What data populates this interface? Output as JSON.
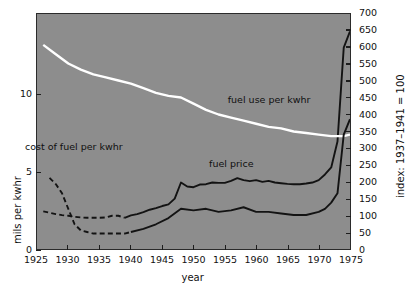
{
  "chart_data": {
    "type": "line",
    "title": "",
    "xlabel": "year",
    "ylabel_left": "mils per kwhr",
    "ylabel_right": "index: 1937–1941 = 100",
    "plot_background": "#8d8d8d",
    "grid": false,
    "legend_position": "inline-annotations",
    "xlim": [
      1925,
      1975
    ],
    "x_ticks": [
      1925,
      1930,
      1935,
      1940,
      1945,
      1950,
      1955,
      1960,
      1965,
      1970,
      1975
    ],
    "x_tick_labels": [
      "1925",
      "1930",
      "1935",
      "1940",
      "1945",
      "1950",
      "1955",
      "1960",
      "1965",
      "1970",
      "1975"
    ],
    "ylim_left": [
      0,
      15.2
    ],
    "y_ticks_left": [
      0,
      5,
      10
    ],
    "y_tick_labels_left": [
      "0",
      "5",
      "10"
    ],
    "ylim_right": [
      0,
      700
    ],
    "y_ticks_right": [
      0,
      50,
      100,
      150,
      200,
      250,
      300,
      350,
      400,
      450,
      500,
      550,
      600,
      650,
      700
    ],
    "y_tick_labels_right": [
      "0",
      "50",
      "100",
      "150",
      "200",
      "250",
      "300",
      "350",
      "400",
      "450",
      "500",
      "550",
      "600",
      "650",
      "700"
    ],
    "series": [
      {
        "name": "fuel price",
        "axis": "right",
        "units": "index: 1937-1941 = 100",
        "color": "#131313",
        "style": "solid-with-dashed-head",
        "dashed_until": 1939,
        "annotation": "fuel price",
        "x": [
          1926,
          1927,
          1928,
          1929,
          1930,
          1931,
          1932,
          1933,
          1934,
          1935,
          1936,
          1937,
          1938,
          1939,
          1940,
          1941,
          1942,
          1943,
          1944,
          1945,
          1946,
          1947,
          1948,
          1949,
          1950,
          1951,
          1952,
          1953,
          1954,
          1955,
          1956,
          1957,
          1958,
          1959,
          1960,
          1961,
          1962,
          1963,
          1964,
          1965,
          1966,
          1967,
          1968,
          1969,
          1970,
          1971,
          1972,
          1973,
          1974,
          1975
        ],
        "values": [
          112,
          108,
          104,
          101,
          99,
          96,
          94,
          93,
          93,
          93,
          94,
          99,
          99,
          93,
          100,
          104,
          110,
          117,
          122,
          128,
          133,
          150,
          198,
          186,
          184,
          192,
          193,
          198,
          197,
          197,
          203,
          211,
          205,
          202,
          205,
          200,
          203,
          198,
          196,
          194,
          193,
          193,
          195,
          198,
          205,
          222,
          243,
          320,
          600,
          648
        ]
      },
      {
        "name": "fuel use per kwhr",
        "axis": "left",
        "units": "mils per kwhr",
        "color": "#ffffff",
        "style": "solid",
        "annotation": "fuel use per kwhr",
        "x": [
          1926,
          1928,
          1930,
          1932,
          1934,
          1936,
          1938,
          1940,
          1942,
          1944,
          1946,
          1948,
          1950,
          1952,
          1954,
          1956,
          1958,
          1960,
          1962,
          1964,
          1966,
          1968,
          1970,
          1972,
          1974,
          1975
        ],
        "values": [
          13.2,
          12.6,
          12.0,
          11.6,
          11.3,
          11.1,
          10.9,
          10.7,
          10.4,
          10.1,
          9.9,
          9.8,
          9.4,
          9.0,
          8.7,
          8.5,
          8.3,
          8.1,
          7.9,
          7.8,
          7.6,
          7.5,
          7.4,
          7.3,
          7.3,
          7.4
        ]
      },
      {
        "name": "cost of fuel per kwhr",
        "axis": "left",
        "units": "mils per kwhr",
        "color": "#131313",
        "style": "dashed-then-solid",
        "dashed_until": 1940,
        "annotation": "cost of fuel per kwhr",
        "x": [
          1927,
          1928,
          1929,
          1930,
          1931,
          1932,
          1933,
          1934,
          1935,
          1936,
          1937,
          1938,
          1939,
          1940,
          1942,
          1944,
          1946,
          1948,
          1950,
          1952,
          1954,
          1956,
          1958,
          1960,
          1962,
          1964,
          1966,
          1968,
          1970,
          1971,
          1972,
          1973,
          1974,
          1975
        ],
        "values": [
          4.6,
          4.2,
          3.6,
          2.6,
          1.6,
          1.2,
          1.1,
          1.0,
          1.0,
          1.0,
          1.0,
          1.0,
          1.0,
          1.1,
          1.3,
          1.6,
          2.0,
          2.6,
          2.5,
          2.6,
          2.4,
          2.5,
          2.7,
          2.4,
          2.4,
          2.3,
          2.2,
          2.2,
          2.4,
          2.6,
          3.0,
          3.6,
          7.4,
          8.4
        ]
      }
    ],
    "annotations": [
      {
        "text": "fuel price",
        "x": 1956,
        "y_right": 255
      },
      {
        "text": "fuel use per kwhr",
        "x": 1962,
        "y_left": 9.6
      },
      {
        "text": "cost of fuel per kwhr",
        "x": 1931,
        "y_left": 6.6
      }
    ]
  }
}
